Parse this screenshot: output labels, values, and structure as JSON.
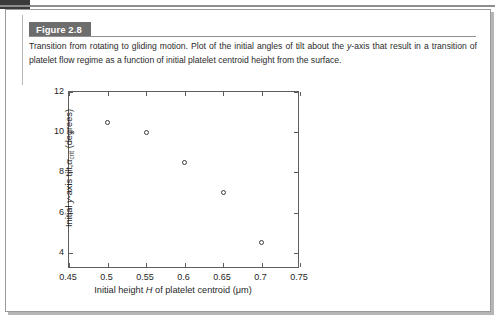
{
  "figure": {
    "label": "Figure 2.8",
    "caption_line1": "Transition from rotating to gliding motion. Plot of the initial angles of tilt about the ",
    "caption_italic1": "y",
    "caption_line2": "-axis that result in a transition of",
    "caption_line3": "platelet flow regime as a function of initial platelet centroid height from the surface."
  },
  "chart_data": {
    "type": "scatter",
    "title": "",
    "xlabel_pre": "Initial height ",
    "xlabel_italic": "H",
    "xlabel_post": " of platelet centroid (μm)",
    "ylabel_pre": "Initial ",
    "ylabel_italic": "y",
    "ylabel_mid": "-axis tilt,",
    "ylabel_alpha": "α",
    "ylabel_sub": "crit",
    "ylabel_post": " (degrees)",
    "x": [
      0.5,
      0.55,
      0.6,
      0.65,
      0.7
    ],
    "y": [
      10.5,
      10.0,
      8.5,
      7.0,
      4.5
    ],
    "xlim": [
      0.45,
      0.75
    ],
    "ylim": [
      3.2,
      12.0
    ],
    "xticks": [
      0.45,
      0.5,
      0.55,
      0.6,
      0.65,
      0.7,
      0.75
    ],
    "xticklabels": [
      "0.45",
      "0.5",
      "0.55",
      "0.6",
      "0.65",
      "0.7",
      "0.75"
    ],
    "yticks": [
      4,
      6,
      8,
      10,
      12
    ],
    "yticklabels": [
      "4",
      "6",
      "8",
      "10",
      "12"
    ],
    "grid": false,
    "legend": null,
    "marker": "open-circle",
    "marker_color": "#3a3a3a"
  },
  "colors": {
    "label_bg": "#6d6d6d",
    "label_text": "#ffffff",
    "axis": "#5d5d5d",
    "text": "#1f1f1f",
    "page_border": "#9a9a9a"
  }
}
